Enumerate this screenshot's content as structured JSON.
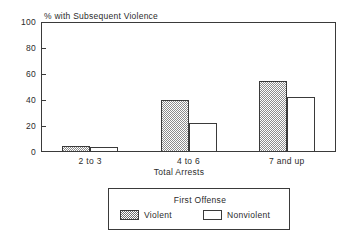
{
  "chart_data": {
    "type": "bar",
    "title": "",
    "ylabel": "% with Subsequent Violence",
    "xlabel": "Total Arrests",
    "categories": [
      "2 to 3",
      "4 to 6",
      "7 and up"
    ],
    "series": [
      {
        "name": "Violent",
        "values": [
          5,
          40,
          55
        ],
        "fill": "hatched"
      },
      {
        "name": "Nonviolent",
        "values": [
          4,
          22,
          42
        ],
        "fill": "white"
      }
    ],
    "ylim": [
      0,
      100
    ],
    "yticks": [
      0,
      20,
      40,
      60,
      80,
      100
    ],
    "ytick_labels": [
      "0",
      "20",
      "40",
      "60",
      "80",
      "100"
    ],
    "grid": false,
    "legend_position": "below-axes",
    "legend_title": "First Offense",
    "colors": {
      "axis": "#3a3a3a",
      "text": "#2b2b2b",
      "violent_fill": "#8d8d8d",
      "nonviolent_fill": "#ffffff",
      "background": "#ffffff"
    }
  },
  "legend": {
    "title": "First Offense",
    "entries": [
      {
        "label": "Violent",
        "swatch": "hatched-swatch"
      },
      {
        "label": "Nonviolent",
        "swatch": "white-swatch"
      }
    ]
  }
}
